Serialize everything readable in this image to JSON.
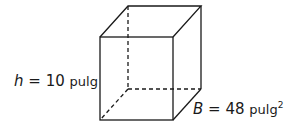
{
  "figure": {
    "type": "rectangular prism",
    "height_label": {
      "variable": "h",
      "equals": "=",
      "value": "10",
      "unit": "pulg"
    },
    "base_label": {
      "variable": "B",
      "equals": "=",
      "value": "48",
      "unit": "pulg",
      "exponent": "2"
    }
  },
  "colors": {
    "stroke": "#1a1a1a",
    "background": "#ffffff"
  }
}
